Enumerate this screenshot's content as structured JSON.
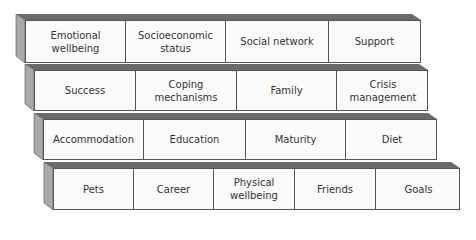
{
  "diagram": {
    "type": "stacked-block-wall",
    "rows": [
      {
        "cells": [
          "Emotional wellbeing",
          "Socioeconomic status",
          "Social network",
          "Support"
        ]
      },
      {
        "cells": [
          "Success",
          "Coping mechanisms",
          "Family",
          "Crisis management"
        ]
      },
      {
        "cells": [
          "Accommodation",
          "Education",
          "Maturity",
          "Diet"
        ]
      },
      {
        "cells": [
          "Pets",
          "Career",
          "Physical wellbeing",
          "Friends",
          "Goals"
        ]
      }
    ]
  }
}
